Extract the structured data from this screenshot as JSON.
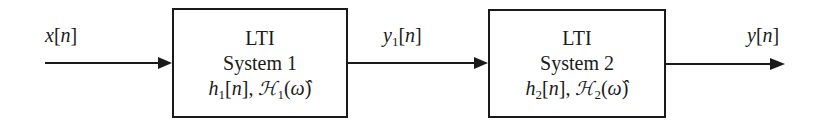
{
  "diagram": {
    "type": "block-diagram-cascade",
    "input": {
      "name": "x",
      "index": "n",
      "text": "x[n]"
    },
    "intermediate": {
      "name": "y",
      "subscript": "1",
      "index": "n",
      "text": "y1[n]"
    },
    "output": {
      "name": "y",
      "index": "n",
      "text": "y[n]"
    },
    "blocks": [
      {
        "title": "LTI",
        "subtitle": "System 1",
        "impulse_response": {
          "name": "h",
          "subscript": "1",
          "index": "n"
        },
        "frequency_response": {
          "name": "ℋ",
          "subscript": "1",
          "arg": "ω̂"
        }
      },
      {
        "title": "LTI",
        "subtitle": "System 2",
        "impulse_response": {
          "name": "h",
          "subscript": "2",
          "index": "n"
        },
        "frequency_response": {
          "name": "ℋ",
          "subscript": "2",
          "arg": "ω̂"
        }
      }
    ],
    "colors": {
      "line": "#1a1a1a",
      "background": "#ffffff"
    }
  }
}
